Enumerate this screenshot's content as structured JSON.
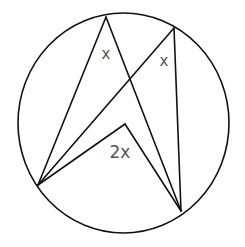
{
  "diagram": {
    "circle": {
      "cx": 123.5,
      "cy": 123,
      "rx": 105.5,
      "ry": 110
    },
    "points": {
      "A": {
        "x": 106,
        "y": 17
      },
      "B": {
        "x": 174,
        "y": 28
      },
      "C": {
        "x": 38,
        "y": 185
      },
      "D": {
        "x": 181,
        "y": 211
      },
      "O": {
        "x": 125,
        "y": 124
      }
    },
    "segments": [
      [
        "C",
        "A"
      ],
      [
        "A",
        "D"
      ],
      [
        "C",
        "B"
      ],
      [
        "B",
        "D"
      ],
      [
        "C",
        "O"
      ],
      [
        "O",
        "D"
      ]
    ],
    "labels": [
      {
        "id": "angle-a",
        "text": "x",
        "x": 106,
        "y": 54,
        "size": 15
      },
      {
        "id": "angle-b",
        "text": "x",
        "x": 164,
        "y": 61,
        "size": 15
      },
      {
        "id": "angle-centre",
        "text": "2x",
        "x": 120,
        "y": 153,
        "size": 17
      }
    ],
    "colors": {
      "line": "#111111",
      "label": "#555555",
      "background": "#ffffff"
    }
  }
}
